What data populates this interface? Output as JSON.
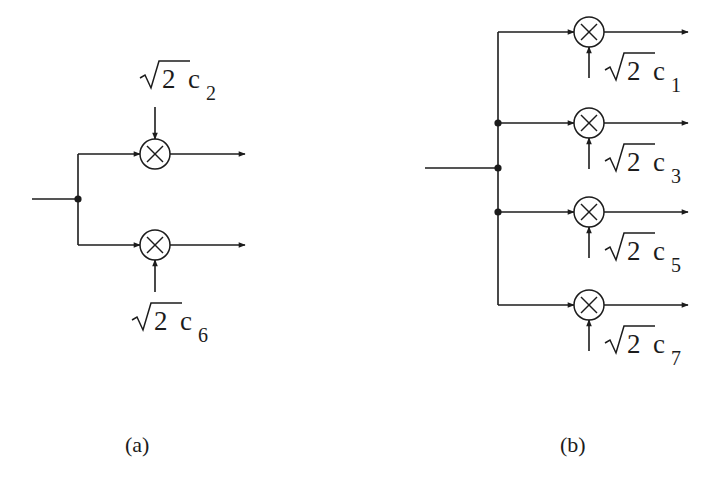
{
  "colors": {
    "ink": "#1c1c1c",
    "background": "#ffffff"
  },
  "diagram_a": {
    "caption": "(a)",
    "input": {
      "label": "",
      "x1": 32,
      "x2": 78,
      "y": 199
    },
    "split_node": {
      "x": 78,
      "y": 199
    },
    "branches": [
      {
        "y": 154,
        "gain_prefix": "2",
        "gain_var": "c",
        "gain_sub": "2",
        "gain_label": "√2 c2",
        "control_from": "top"
      },
      {
        "y": 245,
        "gain_prefix": "2",
        "gain_var": "c",
        "gain_sub": "6",
        "gain_label": "√2 c6",
        "control_from": "bottom"
      }
    ],
    "multiplier_x": 155,
    "output_end_x": 245
  },
  "diagram_b": {
    "caption": "(b)",
    "input": {
      "label": "",
      "x1": 425,
      "x2": 498,
      "y": 168
    },
    "bus_x": 498,
    "nodes": [
      {
        "x": 498,
        "y": 123
      },
      {
        "x": 498,
        "y": 168
      },
      {
        "x": 498,
        "y": 212
      }
    ],
    "branches": [
      {
        "y": 32,
        "gain_prefix": "2",
        "gain_var": "c",
        "gain_sub": "1",
        "gain_label": "√2 c1",
        "control_from": "bottom"
      },
      {
        "y": 123,
        "gain_prefix": "2",
        "gain_var": "c",
        "gain_sub": "3",
        "gain_label": "√2 c3",
        "control_from": "bottom"
      },
      {
        "y": 212,
        "gain_prefix": "2",
        "gain_var": "c",
        "gain_sub": "5",
        "gain_label": "√2 c5",
        "control_from": "bottom"
      },
      {
        "y": 305,
        "gain_prefix": "2",
        "gain_var": "c",
        "gain_sub": "7",
        "gain_label": "√2 c7",
        "control_from": "bottom"
      }
    ],
    "multiplier_x": 589,
    "output_end_x": 688
  },
  "symbols": {
    "multiplier": "multiplier-circle-x-icon",
    "arrow": "arrowhead-icon",
    "junction": "junction-dot-icon"
  }
}
